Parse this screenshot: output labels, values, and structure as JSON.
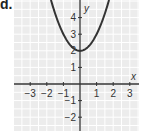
{
  "problem_label": "d.",
  "chart_data": {
    "type": "line",
    "title": "",
    "equation_implied": "y = x^2 + 2",
    "xlabel": "x",
    "ylabel": "y",
    "xlim": [
      -3.5,
      3.5
    ],
    "ylim": [
      -2.7,
      5
    ],
    "x_ticks": [
      -3,
      -2,
      -1,
      1,
      2,
      3
    ],
    "x_tick_labels": [
      "−3",
      "−2",
      "−1",
      "1",
      "2",
      "3"
    ],
    "y_ticks": [
      4,
      3,
      2,
      1,
      -1,
      -2
    ],
    "y_tick_labels": [
      "4",
      "3",
      "2",
      "1",
      "−1",
      "−2"
    ],
    "grid": true,
    "legend": null,
    "series": [
      {
        "name": "parabola",
        "x": [
          -1.73,
          -1.5,
          -1,
          -0.5,
          0,
          0.5,
          1,
          1.5,
          1.73
        ],
        "y": [
          5,
          4.25,
          3,
          2.25,
          2,
          2.25,
          3,
          4.25,
          5
        ]
      }
    ],
    "vertex": [
      0,
      2
    ]
  },
  "colors": {
    "grid_bg": "#ececec",
    "grid_line": "#ffffff",
    "axis": "#333333",
    "curve": "#333333"
  }
}
